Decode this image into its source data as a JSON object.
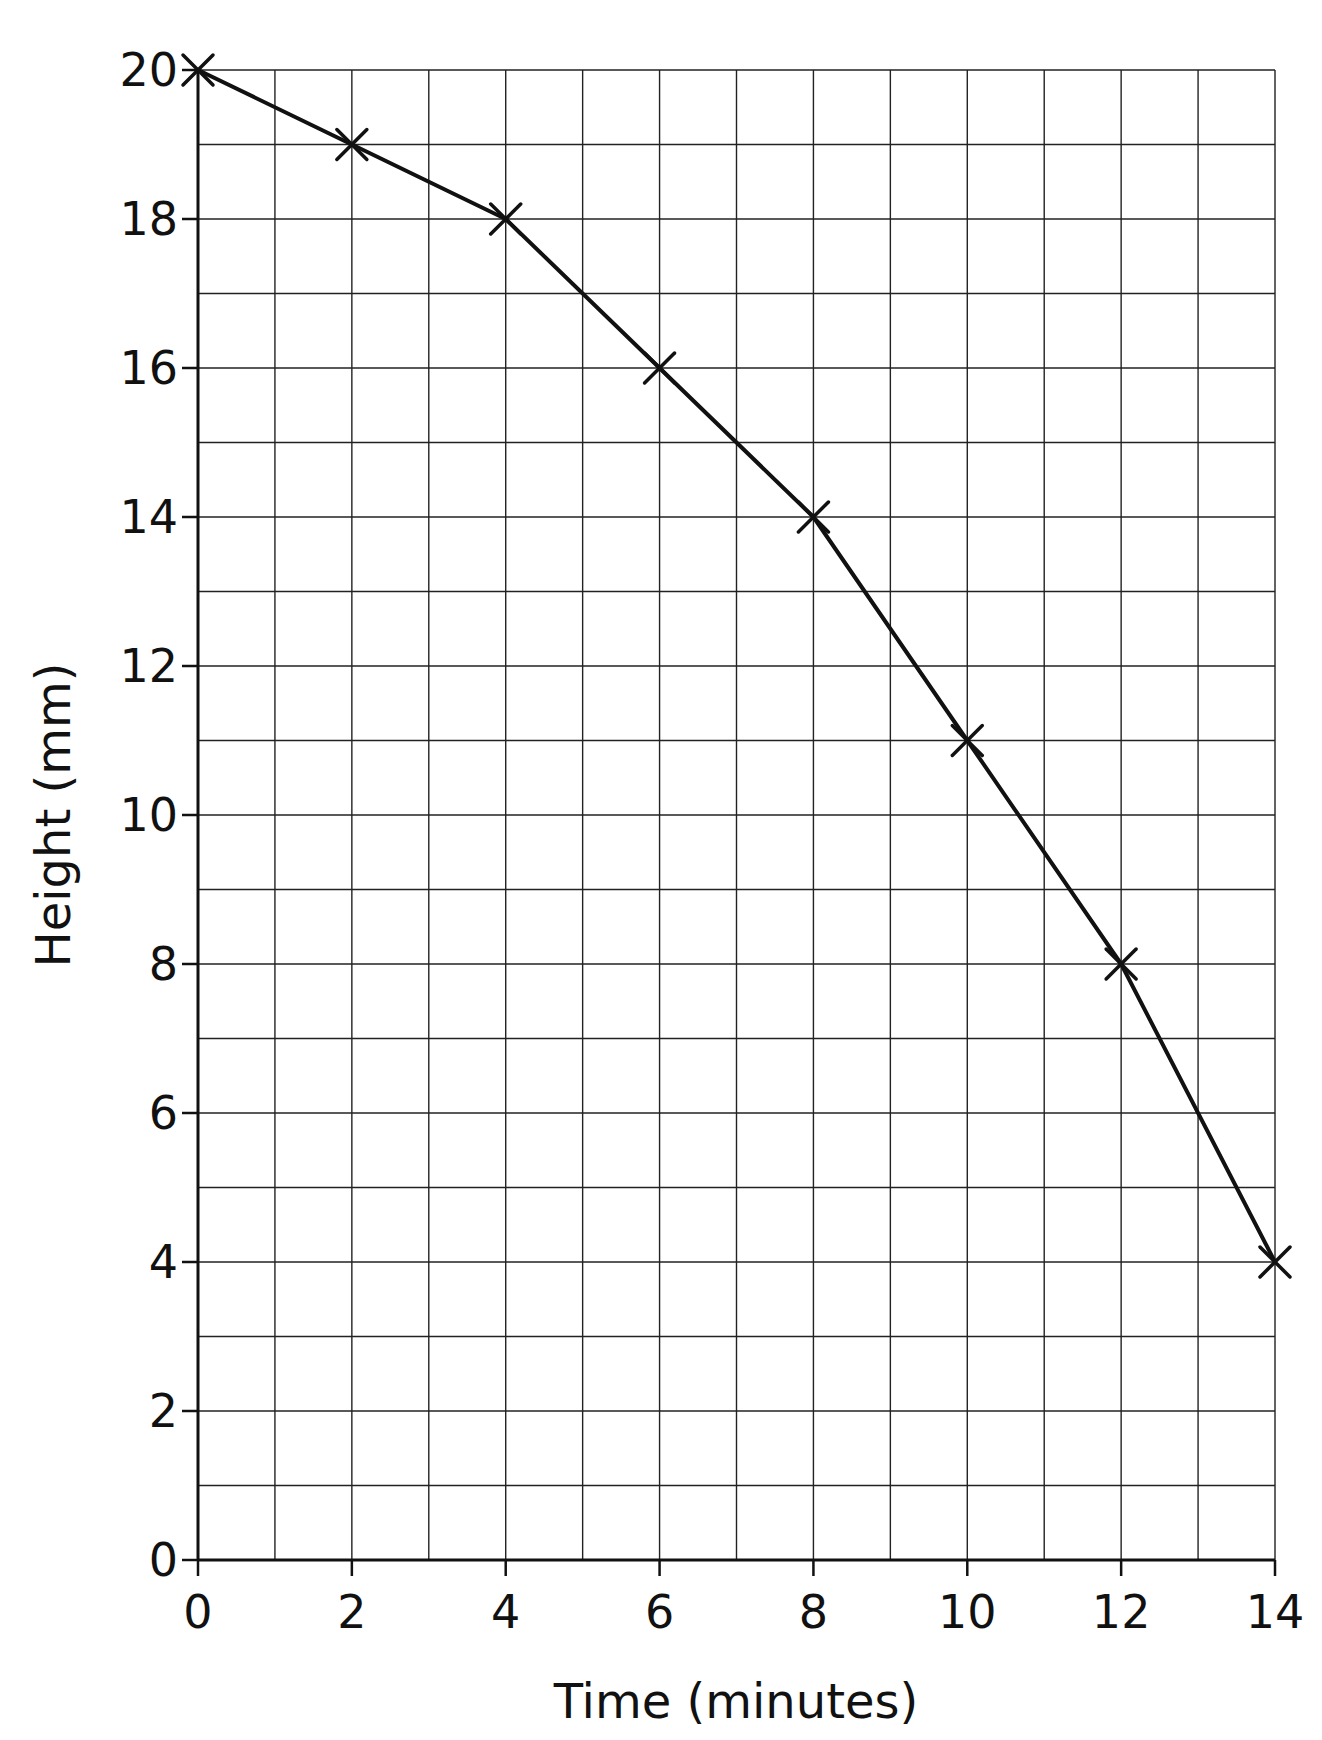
{
  "chart_data": {
    "type": "line",
    "title": "",
    "xlabel": "Time (minutes)",
    "ylabel": "Height (mm)",
    "x": [
      0,
      2,
      4,
      6,
      8,
      10,
      12,
      14
    ],
    "series": [
      {
        "name": "Height",
        "values": [
          20,
          19,
          18,
          16,
          14,
          11,
          8,
          4
        ],
        "marker": "x",
        "color": "#111111"
      }
    ],
    "xlim": [
      0,
      14
    ],
    "ylim": [
      0,
      20
    ],
    "xticks": [
      0,
      2,
      4,
      6,
      8,
      10,
      12,
      14
    ],
    "yticks": [
      0,
      2,
      4,
      6,
      8,
      10,
      12,
      14,
      16,
      18,
      20
    ],
    "grid": {
      "on": true,
      "x_step": 1,
      "y_step": 1
    },
    "legend": null
  },
  "colors": {
    "line": "#111111",
    "grid": "#222222",
    "background": "#ffffff"
  }
}
